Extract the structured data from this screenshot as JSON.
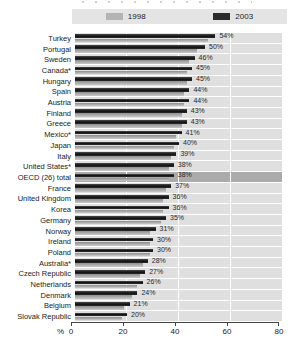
{
  "legend": {
    "items": [
      {
        "label": "1998",
        "color": "#b4b4b4"
      },
      {
        "label": "2003",
        "color": "#2b2b2b"
      }
    ]
  },
  "axis": {
    "unit_label": "%",
    "ticks": [
      "0",
      "20",
      "40",
      "60",
      "80"
    ],
    "max": 80
  },
  "chart_data": {
    "type": "bar",
    "orientation": "horizontal",
    "xlim": [
      0,
      80
    ],
    "grid": "vertical-white-lines",
    "legend_position": "top",
    "highlighted_category": "OECD (26) total",
    "categories": [
      "Turkey",
      "Portugal",
      "Sweden",
      "Canada*",
      "Hungary",
      "Spain",
      "Austria",
      "Finland",
      "Greece",
      "Mexico*",
      "Japan",
      "Italy",
      "United States*",
      "OECD (26) total",
      "France",
      "United Kingdom",
      "Korea",
      "Germany",
      "Norway",
      "Ireland",
      "Poland",
      "Australia*",
      "Czech Republic",
      "Netherlands",
      "Denmark",
      "Belgium",
      "Slovak Republic"
    ],
    "series": [
      {
        "name": "2003",
        "color": "#2b2b2b",
        "values": [
          54,
          50,
          46,
          45,
          45,
          44,
          44,
          43,
          43,
          41,
          40,
          39,
          38,
          38,
          37,
          36,
          36,
          35,
          31,
          30,
          30,
          28,
          27,
          26,
          24,
          21,
          20
        ],
        "value_labels": [
          "54%",
          "50%",
          "46%",
          "45%",
          "45%",
          "44%",
          "44%",
          "43%",
          "43%",
          "41%",
          "40%",
          "39%",
          "38%",
          "38%",
          "37%",
          "36%",
          "36%",
          "35%",
          "31%",
          "30%",
          "30%",
          "28%",
          "27%",
          "26%",
          "24%",
          "21%",
          "20%"
        ]
      },
      {
        "name": "1998",
        "color": "#b4b4b4",
        "values_estimated": true,
        "values": [
          51,
          47,
          44,
          43,
          43,
          42,
          42,
          41,
          41,
          39,
          38,
          37,
          36,
          36,
          35,
          34,
          34,
          33,
          29,
          29,
          29,
          26,
          25,
          24,
          22,
          19,
          18
        ]
      }
    ]
  }
}
